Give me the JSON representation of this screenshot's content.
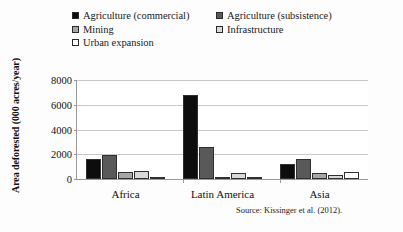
{
  "figure": {
    "source_note": "Source: Kissinger et al. (2012)."
  },
  "legend": {
    "items": [
      {
        "label": "Agriculture (commercial)",
        "color": "#0d0d0d"
      },
      {
        "label": "Agriculture (subsistence)",
        "color": "#595959"
      },
      {
        "label": "Mining",
        "color": "#a6a6a6"
      },
      {
        "label": "Infrastructure",
        "color": "#d9d9d9"
      },
      {
        "label": "Urban expansion",
        "color": "#ffffff"
      }
    ]
  },
  "chart_data": {
    "type": "bar",
    "title": "",
    "xlabel": "",
    "ylabel": "Area deforested (000 acres/year)",
    "ylim": [
      0,
      8000
    ],
    "yticks": [
      0,
      2000,
      4000,
      6000,
      8000
    ],
    "ytick_labels": [
      "0",
      "2000",
      "4000",
      "6000",
      "8000"
    ],
    "grid": true,
    "legend_position": "top",
    "categories": [
      "Africa",
      "Latin America",
      "Asia"
    ],
    "series": [
      {
        "name": "Agriculture (commercial)",
        "color": "#0d0d0d",
        "values": [
          1600,
          6800,
          1200
        ]
      },
      {
        "name": "Agriculture (subsistence)",
        "color": "#595959",
        "values": [
          1950,
          2550,
          1600
        ]
      },
      {
        "name": "Mining",
        "color": "#a6a6a6",
        "values": [
          600,
          150,
          450
        ]
      },
      {
        "name": "Infrastructure",
        "color": "#d9d9d9",
        "values": [
          650,
          450,
          350
        ]
      },
      {
        "name": "Urban expansion",
        "color": "#ffffff",
        "values": [
          200,
          120,
          550
        ]
      }
    ]
  }
}
